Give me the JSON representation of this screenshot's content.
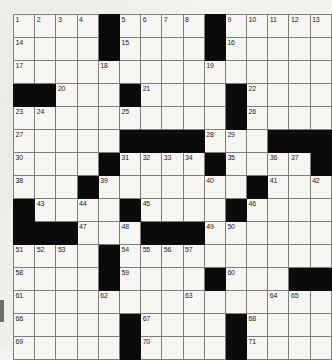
{
  "puzzle": {
    "title": "Crossword Grid",
    "rows": 15,
    "cols": 13,
    "cell_size_px": 22,
    "colors": {
      "block": "#0b0b0b",
      "cell": "#f7f6f3",
      "grid_line": "#7d7d7d",
      "border": "#2b2b2b",
      "number": "#1a1a1a",
      "paper": "#f2f2f0"
    },
    "max_clue_number": 71,
    "grid": [
      [
        {
          "type": "cell",
          "number": "1"
        },
        {
          "type": "cell",
          "number": "2"
        },
        {
          "type": "cell",
          "number": "3"
        },
        {
          "type": "cell",
          "number": "4"
        },
        {
          "type": "block",
          "number": ""
        },
        {
          "type": "cell",
          "number": "5"
        },
        {
          "type": "cell",
          "number": "6"
        },
        {
          "type": "cell",
          "number": "7"
        },
        {
          "type": "cell",
          "number": "8"
        },
        {
          "type": "block",
          "number": ""
        },
        {
          "type": "cell",
          "number": "9"
        },
        {
          "type": "cell",
          "number": "10"
        },
        {
          "type": "cell",
          "number": "11"
        },
        {
          "type": "cell",
          "number": "12"
        },
        {
          "type": "cell",
          "number": "13"
        }
      ],
      [
        {
          "type": "cell",
          "number": "14"
        },
        {
          "type": "cell",
          "number": ""
        },
        {
          "type": "cell",
          "number": ""
        },
        {
          "type": "cell",
          "number": ""
        },
        {
          "type": "block",
          "number": ""
        },
        {
          "type": "cell",
          "number": "15"
        },
        {
          "type": "cell",
          "number": ""
        },
        {
          "type": "cell",
          "number": ""
        },
        {
          "type": "cell",
          "number": ""
        },
        {
          "type": "block",
          "number": ""
        },
        {
          "type": "cell",
          "number": "16"
        },
        {
          "type": "cell",
          "number": ""
        },
        {
          "type": "cell",
          "number": ""
        },
        {
          "type": "cell",
          "number": ""
        },
        {
          "type": "cell",
          "number": ""
        }
      ],
      [
        {
          "type": "cell",
          "number": "17"
        },
        {
          "type": "cell",
          "number": ""
        },
        {
          "type": "cell",
          "number": ""
        },
        {
          "type": "cell",
          "number": ""
        },
        {
          "type": "cell",
          "number": "18"
        },
        {
          "type": "cell",
          "number": ""
        },
        {
          "type": "cell",
          "number": ""
        },
        {
          "type": "cell",
          "number": ""
        },
        {
          "type": "cell",
          "number": ""
        },
        {
          "type": "cell",
          "number": "19"
        },
        {
          "type": "cell",
          "number": ""
        },
        {
          "type": "cell",
          "number": ""
        },
        {
          "type": "cell",
          "number": ""
        },
        {
          "type": "cell",
          "number": ""
        },
        {
          "type": "cell",
          "number": ""
        }
      ],
      [
        {
          "type": "block",
          "number": ""
        },
        {
          "type": "block",
          "number": ""
        },
        {
          "type": "cell",
          "number": "20"
        },
        {
          "type": "cell",
          "number": ""
        },
        {
          "type": "cell",
          "number": ""
        },
        {
          "type": "block",
          "number": ""
        },
        {
          "type": "cell",
          "number": "21"
        },
        {
          "type": "cell",
          "number": ""
        },
        {
          "type": "cell",
          "number": ""
        },
        {
          "type": "cell",
          "number": ""
        },
        {
          "type": "block",
          "number": ""
        },
        {
          "type": "cell",
          "number": "22"
        },
        {
          "type": "cell",
          "number": ""
        },
        {
          "type": "cell",
          "number": ""
        },
        {
          "type": "cell",
          "number": ""
        }
      ],
      [
        {
          "type": "cell",
          "number": "23"
        },
        {
          "type": "cell",
          "number": "24"
        },
        {
          "type": "cell",
          "number": ""
        },
        {
          "type": "cell",
          "number": ""
        },
        {
          "type": "cell",
          "number": ""
        },
        {
          "type": "cell",
          "number": "25"
        },
        {
          "type": "cell",
          "number": ""
        },
        {
          "type": "cell",
          "number": ""
        },
        {
          "type": "cell",
          "number": ""
        },
        {
          "type": "cell",
          "number": ""
        },
        {
          "type": "block",
          "number": ""
        },
        {
          "type": "cell",
          "number": "26"
        },
        {
          "type": "cell",
          "number": ""
        },
        {
          "type": "cell",
          "number": ""
        },
        {
          "type": "cell",
          "number": ""
        }
      ],
      [
        {
          "type": "cell",
          "number": "27"
        },
        {
          "type": "cell",
          "number": ""
        },
        {
          "type": "cell",
          "number": ""
        },
        {
          "type": "cell",
          "number": ""
        },
        {
          "type": "cell",
          "number": ""
        },
        {
          "type": "block",
          "number": ""
        },
        {
          "type": "block",
          "number": ""
        },
        {
          "type": "block",
          "number": ""
        },
        {
          "type": "block",
          "number": ""
        },
        {
          "type": "cell",
          "number": "28"
        },
        {
          "type": "cell",
          "number": "29"
        },
        {
          "type": "cell",
          "number": ""
        },
        {
          "type": "block",
          "number": ""
        },
        {
          "type": "block",
          "number": ""
        },
        {
          "type": "block",
          "number": ""
        }
      ],
      [
        {
          "type": "cell",
          "number": "30"
        },
        {
          "type": "cell",
          "number": ""
        },
        {
          "type": "cell",
          "number": ""
        },
        {
          "type": "cell",
          "number": ""
        },
        {
          "type": "block",
          "number": ""
        },
        {
          "type": "cell",
          "number": "31"
        },
        {
          "type": "cell",
          "number": "32"
        },
        {
          "type": "cell",
          "number": "33"
        },
        {
          "type": "cell",
          "number": "34"
        },
        {
          "type": "block",
          "number": ""
        },
        {
          "type": "cell",
          "number": "35"
        },
        {
          "type": "cell",
          "number": ""
        },
        {
          "type": "cell",
          "number": "36"
        },
        {
          "type": "cell",
          "number": "37"
        },
        {
          "type": "block",
          "number": ""
        }
      ],
      [
        {
          "type": "cell",
          "number": "38"
        },
        {
          "type": "cell",
          "number": ""
        },
        {
          "type": "cell",
          "number": ""
        },
        {
          "type": "block",
          "number": ""
        },
        {
          "type": "cell",
          "number": "39"
        },
        {
          "type": "cell",
          "number": ""
        },
        {
          "type": "cell",
          "number": ""
        },
        {
          "type": "cell",
          "number": ""
        },
        {
          "type": "cell",
          "number": ""
        },
        {
          "type": "cell",
          "number": "40"
        },
        {
          "type": "cell",
          "number": ""
        },
        {
          "type": "block",
          "number": ""
        },
        {
          "type": "cell",
          "number": "41"
        },
        {
          "type": "cell",
          "number": ""
        },
        {
          "type": "cell",
          "number": "42"
        }
      ],
      [
        {
          "type": "block",
          "number": ""
        },
        {
          "type": "cell",
          "number": "43"
        },
        {
          "type": "cell",
          "number": ""
        },
        {
          "type": "cell",
          "number": "44"
        },
        {
          "type": "cell",
          "number": ""
        },
        {
          "type": "block",
          "number": ""
        },
        {
          "type": "cell",
          "number": "45"
        },
        {
          "type": "cell",
          "number": ""
        },
        {
          "type": "cell",
          "number": ""
        },
        {
          "type": "cell",
          "number": ""
        },
        {
          "type": "block",
          "number": ""
        },
        {
          "type": "cell",
          "number": "46"
        },
        {
          "type": "cell",
          "number": ""
        },
        {
          "type": "cell",
          "number": ""
        },
        {
          "type": "cell",
          "number": ""
        }
      ],
      [
        {
          "type": "block",
          "number": ""
        },
        {
          "type": "block",
          "number": ""
        },
        {
          "type": "block",
          "number": ""
        },
        {
          "type": "cell",
          "number": "47"
        },
        {
          "type": "cell",
          "number": ""
        },
        {
          "type": "cell",
          "number": "48"
        },
        {
          "type": "block",
          "number": ""
        },
        {
          "type": "block",
          "number": ""
        },
        {
          "type": "block",
          "number": ""
        },
        {
          "type": "cell",
          "number": "49"
        },
        {
          "type": "cell",
          "number": "50"
        },
        {
          "type": "cell",
          "number": ""
        },
        {
          "type": "cell",
          "number": ""
        },
        {
          "type": "cell",
          "number": ""
        },
        {
          "type": "cell",
          "number": ""
        }
      ],
      [
        {
          "type": "cell",
          "number": "51"
        },
        {
          "type": "cell",
          "number": "52"
        },
        {
          "type": "cell",
          "number": "53"
        },
        {
          "type": "cell",
          "number": ""
        },
        {
          "type": "block",
          "number": ""
        },
        {
          "type": "cell",
          "number": "54"
        },
        {
          "type": "cell",
          "number": "55"
        },
        {
          "type": "cell",
          "number": "56"
        },
        {
          "type": "cell",
          "number": "57"
        },
        {
          "type": "cell",
          "number": ""
        },
        {
          "type": "cell",
          "number": ""
        },
        {
          "type": "cell",
          "number": ""
        },
        {
          "type": "cell",
          "number": ""
        },
        {
          "type": "cell",
          "number": ""
        },
        {
          "type": "cell",
          "number": ""
        }
      ],
      [
        {
          "type": "cell",
          "number": "58"
        },
        {
          "type": "cell",
          "number": ""
        },
        {
          "type": "cell",
          "number": ""
        },
        {
          "type": "cell",
          "number": ""
        },
        {
          "type": "block",
          "number": ""
        },
        {
          "type": "cell",
          "number": "59"
        },
        {
          "type": "cell",
          "number": ""
        },
        {
          "type": "cell",
          "number": ""
        },
        {
          "type": "cell",
          "number": ""
        },
        {
          "type": "block",
          "number": ""
        },
        {
          "type": "cell",
          "number": "60"
        },
        {
          "type": "cell",
          "number": ""
        },
        {
          "type": "cell",
          "number": ""
        },
        {
          "type": "block",
          "number": ""
        },
        {
          "type": "block",
          "number": ""
        }
      ],
      [
        {
          "type": "cell",
          "number": "61"
        },
        {
          "type": "cell",
          "number": ""
        },
        {
          "type": "cell",
          "number": ""
        },
        {
          "type": "cell",
          "number": ""
        },
        {
          "type": "cell",
          "number": "62"
        },
        {
          "type": "cell",
          "number": ""
        },
        {
          "type": "cell",
          "number": ""
        },
        {
          "type": "cell",
          "number": ""
        },
        {
          "type": "cell",
          "number": "63"
        },
        {
          "type": "cell",
          "number": ""
        },
        {
          "type": "cell",
          "number": ""
        },
        {
          "type": "cell",
          "number": ""
        },
        {
          "type": "cell",
          "number": "64"
        },
        {
          "type": "cell",
          "number": "65"
        },
        {
          "type": "cell",
          "number": ""
        }
      ],
      [
        {
          "type": "cell",
          "number": "66"
        },
        {
          "type": "cell",
          "number": ""
        },
        {
          "type": "cell",
          "number": ""
        },
        {
          "type": "cell",
          "number": ""
        },
        {
          "type": "cell",
          "number": ""
        },
        {
          "type": "block",
          "number": ""
        },
        {
          "type": "cell",
          "number": "67"
        },
        {
          "type": "cell",
          "number": ""
        },
        {
          "type": "cell",
          "number": ""
        },
        {
          "type": "cell",
          "number": ""
        },
        {
          "type": "block",
          "number": ""
        },
        {
          "type": "cell",
          "number": "68"
        },
        {
          "type": "cell",
          "number": ""
        },
        {
          "type": "cell",
          "number": ""
        },
        {
          "type": "cell",
          "number": ""
        }
      ],
      [
        {
          "type": "cell",
          "number": "69"
        },
        {
          "type": "cell",
          "number": ""
        },
        {
          "type": "cell",
          "number": ""
        },
        {
          "type": "cell",
          "number": ""
        },
        {
          "type": "cell",
          "number": ""
        },
        {
          "type": "block",
          "number": ""
        },
        {
          "type": "cell",
          "number": "70"
        },
        {
          "type": "cell",
          "number": ""
        },
        {
          "type": "cell",
          "number": ""
        },
        {
          "type": "cell",
          "number": ""
        },
        {
          "type": "block",
          "number": ""
        },
        {
          "type": "cell",
          "number": "71"
        },
        {
          "type": "cell",
          "number": ""
        },
        {
          "type": "cell",
          "number": ""
        },
        {
          "type": "cell",
          "number": ""
        }
      ]
    ]
  }
}
